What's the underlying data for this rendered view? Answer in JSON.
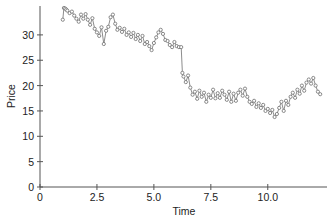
{
  "chart_data": {
    "type": "line",
    "title": "",
    "xlabel": "Time",
    "ylabel": "Price",
    "xlim": [
      0,
      12.6
    ],
    "ylim": [
      0,
      35.7
    ],
    "xticks": [
      0,
      2.5,
      5.0,
      7.5,
      10.0
    ],
    "xtick_labels": [
      "0",
      "2.5",
      "5.0",
      "7.5",
      "10.0"
    ],
    "yticks": [
      0,
      5,
      10,
      15,
      20,
      25,
      30
    ],
    "ytick_labels": [
      "0",
      "5",
      "10",
      "15",
      "20",
      "25",
      "30"
    ],
    "grid": false,
    "legend": null,
    "marker": "open-circle",
    "line_color": "#6e6e6e",
    "marker_color": "#6e6e6e",
    "series": [
      {
        "name": "Price",
        "x": [
          1.0,
          1.05,
          1.1,
          1.15,
          1.2,
          1.3,
          1.4,
          1.5,
          1.6,
          1.7,
          1.8,
          1.9,
          2.0,
          2.1,
          2.2,
          2.3,
          2.4,
          2.5,
          2.6,
          2.7,
          2.8,
          2.9,
          3.0,
          3.1,
          3.2,
          3.3,
          3.4,
          3.5,
          3.6,
          3.7,
          3.8,
          3.9,
          4.0,
          4.1,
          4.2,
          4.3,
          4.4,
          4.5,
          4.6,
          4.7,
          4.8,
          4.9,
          5.0,
          5.1,
          5.2,
          5.3,
          5.4,
          5.5,
          5.6,
          5.7,
          5.8,
          5.9,
          6.0,
          6.1,
          6.2,
          6.25,
          6.3,
          6.4,
          6.5,
          6.6,
          6.7,
          6.8,
          6.9,
          7.0,
          7.1,
          7.2,
          7.3,
          7.4,
          7.5,
          7.6,
          7.7,
          7.8,
          7.9,
          8.0,
          8.1,
          8.2,
          8.3,
          8.4,
          8.5,
          8.6,
          8.7,
          8.8,
          8.9,
          9.0,
          9.1,
          9.2,
          9.3,
          9.4,
          9.5,
          9.6,
          9.7,
          9.8,
          9.9,
          10.0,
          10.1,
          10.2,
          10.3,
          10.4,
          10.5,
          10.6,
          10.7,
          10.8,
          10.9,
          11.0,
          11.1,
          11.2,
          11.3,
          11.4,
          11.5,
          11.6,
          11.7,
          11.8,
          11.9,
          12.0,
          12.1,
          12.2,
          12.3
        ],
        "values": [
          33.0,
          35.3,
          35.2,
          35.0,
          34.8,
          34.3,
          34.6,
          33.8,
          33.2,
          32.6,
          34.0,
          33.2,
          34.1,
          33.0,
          32.0,
          33.3,
          31.2,
          30.5,
          29.8,
          31.5,
          28.2,
          30.8,
          31.6,
          33.5,
          34.0,
          32.2,
          31.0,
          31.4,
          30.6,
          31.2,
          30.0,
          30.5,
          29.6,
          30.4,
          29.2,
          30.0,
          28.8,
          29.8,
          28.2,
          28.6,
          27.8,
          27.0,
          28.4,
          29.5,
          30.5,
          31.0,
          30.2,
          29.0,
          28.8,
          28.0,
          27.6,
          28.6,
          27.8,
          27.6,
          27.6,
          22.5,
          21.8,
          20.7,
          22.0,
          19.6,
          18.2,
          18.8,
          17.4,
          19.0,
          17.8,
          18.6,
          16.8,
          18.2,
          17.6,
          19.2,
          17.5,
          18.5,
          17.6,
          19.0,
          18.2,
          17.2,
          18.8,
          16.8,
          18.4,
          17.0,
          18.6,
          19.2,
          18.0,
          19.4,
          17.8,
          16.8,
          16.4,
          17.0,
          15.8,
          16.5,
          15.6,
          16.2,
          15.0,
          15.4,
          14.6,
          15.2,
          13.8,
          14.4,
          15.6,
          16.8,
          15.0,
          17.0,
          16.2,
          17.8,
          18.6,
          17.6,
          19.2,
          18.4,
          20.0,
          19.0,
          20.6,
          21.2,
          20.4,
          21.5,
          20.0,
          18.8,
          18.3
        ]
      }
    ]
  }
}
